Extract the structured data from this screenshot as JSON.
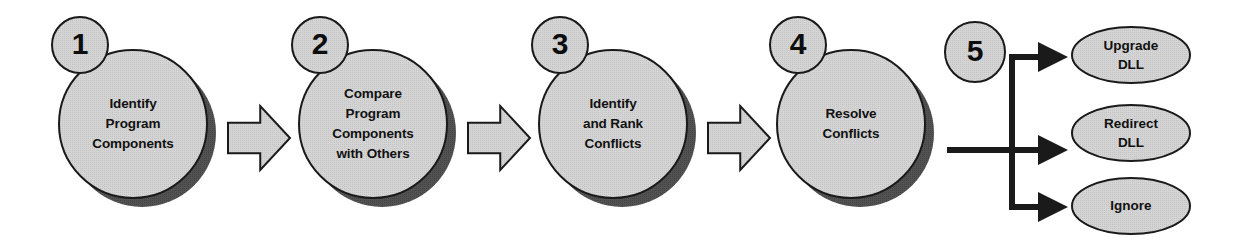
{
  "diagram": {
    "type": "process-flow",
    "colors": {
      "shape_fill": "#d2d2d2",
      "shape_outline": "#1a1a1a",
      "shadow": "#4f4f4f",
      "arrow_fill": "#d2d2d2",
      "connector": "#1a1a1a",
      "text": "#111111",
      "background": "#ffffff"
    },
    "steps": [
      {
        "number": "1",
        "lines": [
          "Identify",
          "Program",
          "Components"
        ],
        "cx": 133,
        "cy": 124,
        "r": 74,
        "badge_cx": 80,
        "badge_cy": 45,
        "badge_r": 28
      },
      {
        "number": "2",
        "lines": [
          "Compare",
          "Program",
          "Components",
          "with Others"
        ],
        "cx": 373,
        "cy": 124,
        "r": 74,
        "badge_cx": 320,
        "badge_cy": 45,
        "badge_r": 28
      },
      {
        "number": "3",
        "lines": [
          "Identify",
          "and Rank",
          "Conflicts"
        ],
        "cx": 613,
        "cy": 124,
        "r": 74,
        "badge_cx": 560,
        "badge_cy": 45,
        "badge_r": 28
      },
      {
        "number": "4",
        "lines": [
          "Resolve",
          "Conflicts"
        ],
        "cx": 851,
        "cy": 124,
        "r": 74,
        "badge_cx": 798,
        "badge_cy": 45,
        "badge_r": 28
      }
    ],
    "branch_badge": {
      "number": "5",
      "cx": 975,
      "cy": 52,
      "r": 30
    },
    "chevrons": [
      {
        "x": 228,
        "y": 106,
        "w": 62,
        "h": 64
      },
      {
        "x": 468,
        "y": 106,
        "w": 62,
        "h": 64
      },
      {
        "x": 708,
        "y": 106,
        "w": 62,
        "h": 64
      }
    ],
    "connector": {
      "stem_start_x": 947,
      "stem_y": 150,
      "trunk_x": 1012,
      "branch_top_y": 57,
      "branch_mid_y": 150,
      "branch_bottom_y": 207,
      "arrow_tip_x": 1068,
      "stroke_width": 6
    },
    "outcomes": [
      {
        "lines": [
          "Upgrade",
          "DLL"
        ],
        "cx": 1131,
        "cy": 55,
        "rx": 59,
        "ry": 28
      },
      {
        "lines": [
          "Redirect",
          "DLL"
        ],
        "cx": 1131,
        "cy": 133,
        "rx": 59,
        "ry": 28
      },
      {
        "lines": [
          "Ignore"
        ],
        "cx": 1131,
        "cy": 206,
        "rx": 59,
        "ry": 28
      }
    ]
  }
}
